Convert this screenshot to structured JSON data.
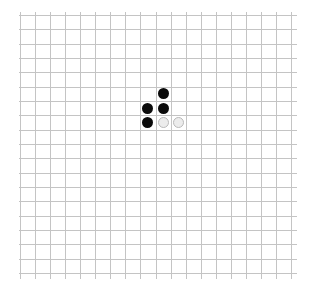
{
  "board": {
    "grid_lines": 19,
    "cells_per_side": 18,
    "line_color": "#c4c4c4",
    "background": "#ffffff",
    "stones": [
      {
        "color": "black",
        "col": 9,
        "row": 5
      },
      {
        "color": "black",
        "col": 8,
        "row": 6
      },
      {
        "color": "black",
        "col": 9,
        "row": 6
      },
      {
        "color": "black",
        "col": 8,
        "row": 7
      },
      {
        "color": "white",
        "col": 9,
        "row": 7
      },
      {
        "color": "white",
        "col": 10,
        "row": 7
      }
    ]
  }
}
